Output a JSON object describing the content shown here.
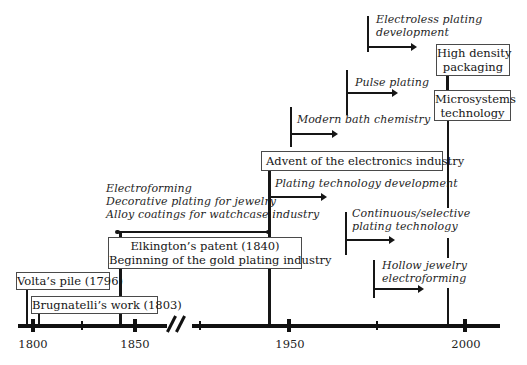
{
  "figure": {
    "type": "timeline-diagram",
    "colors": {
      "ink": "#1a1a1a",
      "background": "#ffffff",
      "box_border": "#4a4a4a"
    },
    "axis": {
      "year_labels": [
        "1800",
        "1850",
        "1950",
        "2000"
      ],
      "has_break_between": "1850 and 1950"
    },
    "floating_labels": {
      "electroless": {
        "line1": "Electroless plating",
        "line2": "development"
      },
      "pulse": {
        "line1": "Pulse plating"
      },
      "modern_bath": {
        "line1": "Modern bath chemistry"
      },
      "plating_dev": {
        "line1": "Plating technology development"
      },
      "electroforming": {
        "line1": "Electroforming",
        "line2": "Decorative plating for jewelry",
        "line3": "Alloy coatings for watchcase industry"
      },
      "continuous": {
        "line1": "Continuous/selective",
        "line2": "plating technology"
      },
      "hollow": {
        "line1": "Hollow jewelry",
        "line2": "electroforming"
      }
    },
    "boxed_labels": {
      "advent": {
        "line1": "Advent of the electronics industry"
      },
      "elkington": {
        "line1": "Elkington’s patent (1840)",
        "line2": "Beginning of the gold plating industry"
      },
      "volta": {
        "line1": "Volta’s pile (1796)"
      },
      "brugnatelli": {
        "line1": "Brugnatelli’s work (1803)"
      },
      "high_density": {
        "line1": "High density",
        "line2": "packaging"
      },
      "microsystems": {
        "line1": "Microsystems",
        "line2": "technology"
      }
    }
  }
}
